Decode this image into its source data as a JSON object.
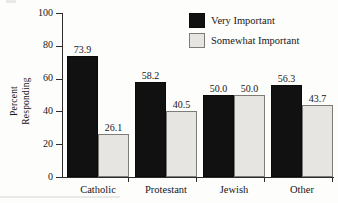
{
  "chart_data": {
    "type": "bar",
    "title": "",
    "subtitle": "",
    "xlabel": "",
    "ylabel": "Percent Responding",
    "ylabel_lines": [
      "Percent",
      "Responding"
    ],
    "categories": [
      "Catholic",
      "Protestant",
      "Jewish",
      "Other"
    ],
    "series": [
      {
        "name": "Very Important",
        "color": "#121111",
        "values": [
          73.9,
          58.2,
          50.0,
          56.3
        ],
        "value_labels": [
          "73.9",
          "58.2",
          "50.0",
          "56.3"
        ]
      },
      {
        "name": "Somewhat Important",
        "color": "#e6e5e2",
        "values": [
          26.1,
          40.5,
          50.0,
          43.7
        ],
        "value_labels": [
          "26.1",
          "40.5",
          "50.0",
          "43.7"
        ]
      }
    ],
    "ylim": [
      0,
      100
    ],
    "yticks": [
      0,
      20,
      40,
      60,
      80,
      100
    ],
    "ytick_labels": [
      "0",
      "20",
      "40",
      "60",
      "80",
      "100"
    ],
    "grid": false,
    "legend_position": "top-right",
    "axis_color": "#2d2b2c",
    "background": "#fdfdfc"
  },
  "legend": {
    "items": [
      {
        "label": "Very Important",
        "swatch": "dark"
      },
      {
        "label": "Somewhat Important",
        "swatch": "light"
      }
    ]
  },
  "axes": {
    "y_title_line1": "Percent",
    "y_title_line2": "Responding"
  }
}
